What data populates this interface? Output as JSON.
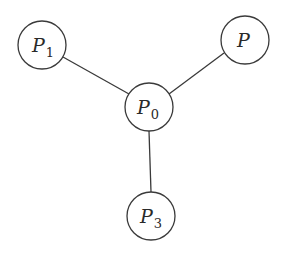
{
  "diagram": {
    "type": "star-graph",
    "nodes": [
      {
        "id": "P0",
        "label": "P",
        "subscript": "0",
        "cx": 149,
        "cy": 107,
        "r": 24
      },
      {
        "id": "P1",
        "label": "P",
        "subscript": "1",
        "cx": 42,
        "cy": 45,
        "r": 24
      },
      {
        "id": "P",
        "label": "P",
        "subscript": "",
        "cx": 245,
        "cy": 40,
        "r": 24
      },
      {
        "id": "P3",
        "label": "P",
        "subscript": "3",
        "cx": 151,
        "cy": 216,
        "r": 24
      }
    ],
    "edges": [
      {
        "from": "P0",
        "to": "P1"
      },
      {
        "from": "P0",
        "to": "P"
      },
      {
        "from": "P0",
        "to": "P3"
      }
    ],
    "colors": {
      "stroke": "#3a3a3a",
      "text": "#2a2a2a",
      "background": "#ffffff"
    }
  }
}
